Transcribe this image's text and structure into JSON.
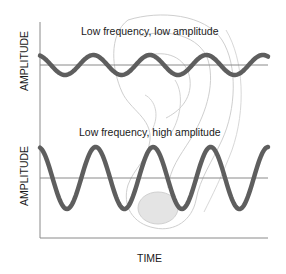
{
  "figure": {
    "top_panel": {
      "title": "Low frequency, low amplitude",
      "ylabel": "AMPLITUDE"
    },
    "bottom_panel": {
      "title": "Low frequency, high amplitude",
      "ylabel": "AMPLITUDE"
    },
    "xlabel": "TIME",
    "background_illustration": "ear-sketch",
    "colors": {
      "wave": "#5e5e5e",
      "baseline": "#8a8a8a",
      "axis": "#8a8a8a",
      "ear": "#c8c8c8"
    }
  }
}
